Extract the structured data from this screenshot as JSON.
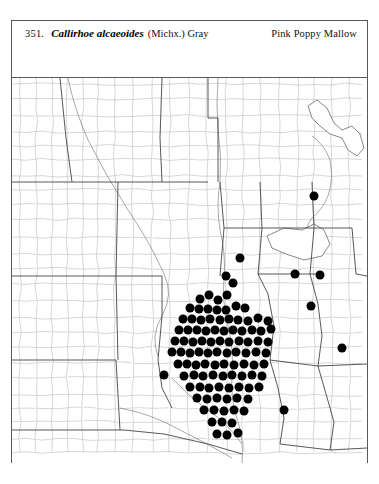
{
  "plate": {
    "number": "351.",
    "scientific_name": "Callirhoe alcaeoides",
    "authority": "(Michx.) Gray",
    "common_name": "Pink Poppy Mallow"
  },
  "map": {
    "type": "dot-distribution-map",
    "region": "Central United States",
    "symbol": "filled-black-circle",
    "symbol_meaning": "county record of occurrence",
    "dot_diameter_px": 9,
    "colors": {
      "dot": "#000000",
      "county_line": "#9a9a9a",
      "state_line": "#3a3a3a",
      "frame": "#585858",
      "background": "#ffffff"
    },
    "occurrence_dots": [
      [
        214,
        198
      ],
      [
        221,
        205
      ],
      [
        228,
        180
      ],
      [
        188,
        221
      ],
      [
        197,
        217
      ],
      [
        206,
        222
      ],
      [
        215,
        217
      ],
      [
        178,
        230
      ],
      [
        187,
        231
      ],
      [
        196,
        231
      ],
      [
        205,
        232
      ],
      [
        214,
        232
      ],
      [
        224,
        228
      ],
      [
        233,
        230
      ],
      [
        171,
        241
      ],
      [
        180,
        241
      ],
      [
        189,
        242
      ],
      [
        198,
        241
      ],
      [
        208,
        242
      ],
      [
        217,
        241
      ],
      [
        226,
        242
      ],
      [
        236,
        243
      ],
      [
        246,
        240
      ],
      [
        256,
        243
      ],
      [
        167,
        252
      ],
      [
        176,
        252
      ],
      [
        185,
        252
      ],
      [
        194,
        253
      ],
      [
        203,
        252
      ],
      [
        212,
        253
      ],
      [
        221,
        252
      ],
      [
        230,
        253
      ],
      [
        240,
        252
      ],
      [
        249,
        253
      ],
      [
        259,
        251
      ],
      [
        163,
        263
      ],
      [
        172,
        263
      ],
      [
        181,
        264
      ],
      [
        190,
        263
      ],
      [
        199,
        264
      ],
      [
        208,
        263
      ],
      [
        217,
        264
      ],
      [
        227,
        263
      ],
      [
        236,
        264
      ],
      [
        246,
        263
      ],
      [
        256,
        264
      ],
      [
        160,
        274
      ],
      [
        169,
        274
      ],
      [
        178,
        275
      ],
      [
        187,
        274
      ],
      [
        196,
        275
      ],
      [
        205,
        274
      ],
      [
        215,
        275
      ],
      [
        224,
        274
      ],
      [
        234,
        275
      ],
      [
        244,
        274
      ],
      [
        254,
        275
      ],
      [
        166,
        286
      ],
      [
        175,
        286
      ],
      [
        184,
        287
      ],
      [
        193,
        286
      ],
      [
        203,
        287
      ],
      [
        212,
        286
      ],
      [
        222,
        287
      ],
      [
        232,
        286
      ],
      [
        242,
        287
      ],
      [
        252,
        286
      ],
      [
        152,
        297
      ],
      [
        172,
        298
      ],
      [
        182,
        297
      ],
      [
        191,
        298
      ],
      [
        201,
        297
      ],
      [
        211,
        298
      ],
      [
        220,
        297
      ],
      [
        230,
        298
      ],
      [
        240,
        297
      ],
      [
        250,
        298
      ],
      [
        178,
        309
      ],
      [
        188,
        309
      ],
      [
        197,
        310
      ],
      [
        207,
        309
      ],
      [
        217,
        310
      ],
      [
        227,
        309
      ],
      [
        237,
        310
      ],
      [
        247,
        309
      ],
      [
        185,
        320
      ],
      [
        195,
        321
      ],
      [
        205,
        320
      ],
      [
        215,
        321
      ],
      [
        225,
        320
      ],
      [
        236,
        321
      ],
      [
        192,
        332
      ],
      [
        202,
        332
      ],
      [
        212,
        333
      ],
      [
        222,
        332
      ],
      [
        232,
        333
      ],
      [
        200,
        344
      ],
      [
        210,
        344
      ],
      [
        220,
        345
      ],
      [
        205,
        356
      ],
      [
        215,
        357
      ],
      [
        226,
        355
      ],
      [
        283,
        196
      ],
      [
        308,
        197
      ],
      [
        299,
        228
      ],
      [
        330,
        270
      ],
      [
        272,
        332
      ],
      [
        302,
        118
      ]
    ],
    "total_records": 104
  },
  "icons": {
    "dot": "filled-circle-icon"
  }
}
